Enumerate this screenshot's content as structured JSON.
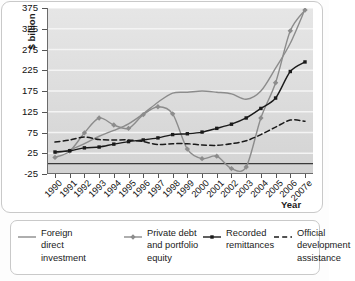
{
  "axes": {
    "y_title": "$ billion",
    "x_title": "Year",
    "y_ticks": [
      "375",
      "325",
      "275",
      "225",
      "175",
      "125",
      "75",
      "25",
      "-25"
    ],
    "x_ticks": [
      "1990",
      "1991",
      "1992",
      "1993",
      "1994",
      "1995",
      "1996",
      "1997",
      "1998",
      "1999",
      "2000",
      "2001",
      "2002",
      "2003",
      "2004",
      "2005",
      "2006",
      "2007e"
    ]
  },
  "legend": {
    "items": [
      {
        "label_line1": "Foreign",
        "label_line2": "direct",
        "label_line3": "investment",
        "key": "foreign-direct-investment",
        "marker": "line-plain",
        "color": "#8c8c8c"
      },
      {
        "label_line1": "Private debt",
        "label_line2": "and portfolio",
        "label_line3": "equity",
        "key": "private-debt-portfolio-equity",
        "marker": "line-diamond",
        "color": "#8c8c8c"
      },
      {
        "label_line1": "Recorded",
        "label_line2": "remittances",
        "label_line3": "",
        "key": "recorded-remittances",
        "marker": "line-square",
        "color": "#1a1a1a"
      },
      {
        "label_line1": "Official",
        "label_line2": "development",
        "label_line3": "assistance",
        "key": "official-development-assistance",
        "marker": "line-dashed",
        "color": "#1a1a1a"
      }
    ]
  },
  "chart_data": {
    "type": "line",
    "title": "",
    "xlabel": "Year",
    "ylabel": "$ billion",
    "x": [
      "1990",
      "1991",
      "1992",
      "1993",
      "1994",
      "1995",
      "1996",
      "1997",
      "1998",
      "1999",
      "2000",
      "2001",
      "2002",
      "2003",
      "2004",
      "2005",
      "2006",
      "2007e"
    ],
    "ylim": [
      -25,
      375
    ],
    "ytick_step": 50,
    "grid": true,
    "grid_orientation": "horizontal",
    "legend_position": "below-plot",
    "series": [
      {
        "name": "Foreign direct investment",
        "color": "#8c8c8c",
        "style": "solid",
        "markers": false,
        "values": [
          25,
          33,
          48,
          66,
          80,
          96,
          120,
          148,
          170,
          172,
          175,
          172,
          168,
          155,
          175,
          230,
          290,
          372
        ]
      },
      {
        "name": "Private debt and portfolio equity",
        "color": "#8c8c8c",
        "style": "solid",
        "markers": "diamond",
        "values": [
          15,
          30,
          74,
          110,
          93,
          85,
          118,
          137,
          120,
          35,
          12,
          18,
          -12,
          -8,
          110,
          195,
          320,
          370
        ]
      },
      {
        "name": "Recorded remittances",
        "color": "#1a1a1a",
        "style": "solid",
        "markers": "square",
        "values": [
          28,
          31,
          38,
          40,
          47,
          53,
          57,
          62,
          70,
          72,
          76,
          85,
          95,
          110,
          133,
          158,
          222,
          245
        ]
      },
      {
        "name": "Official development assistance",
        "color": "#1a1a1a",
        "style": "dashed",
        "markers": false,
        "values": [
          52,
          57,
          64,
          58,
          57,
          57,
          53,
          46,
          48,
          48,
          45,
          44,
          48,
          55,
          70,
          88,
          105,
          102
        ]
      }
    ]
  }
}
